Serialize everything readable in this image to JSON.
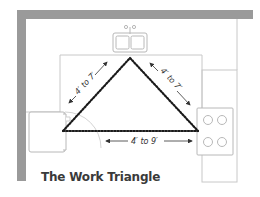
{
  "diagram": {
    "title": "The Work Triangle",
    "colors": {
      "wall": "#9a9a9a",
      "outline": "#c8c8c8",
      "triangle": "#1a1a1a",
      "text": "#333333",
      "background": "#ffffff"
    },
    "elements": {
      "sink": {
        "label": "sink",
        "basins": 2
      },
      "refrigerator": {
        "label": "refrigerator"
      },
      "stove": {
        "label": "stove",
        "burners": 4
      }
    },
    "edges": [
      {
        "from": "refrigerator",
        "to": "sink",
        "label": "4′ to 7′"
      },
      {
        "from": "sink",
        "to": "stove",
        "label": "4′ to 7′"
      },
      {
        "from": "refrigerator",
        "to": "stove",
        "label": "4′ to 9′"
      }
    ]
  }
}
